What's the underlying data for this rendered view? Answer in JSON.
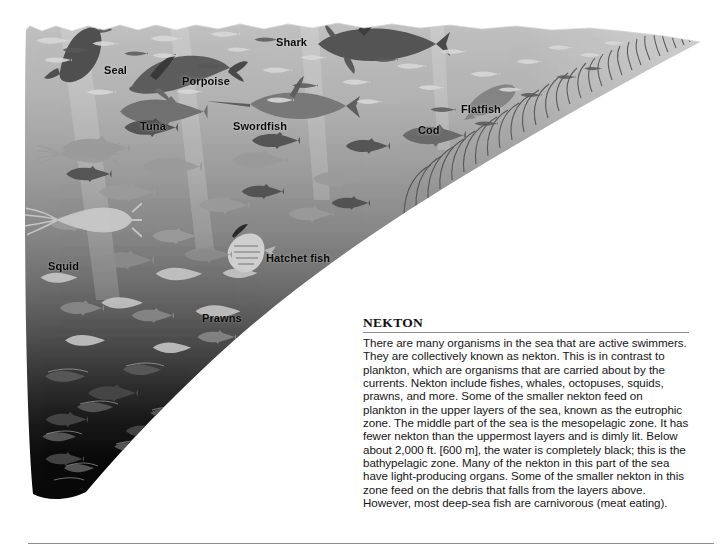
{
  "figure": {
    "title_visible": false,
    "scene_name": "ocean-cross-section",
    "description_alt": "Grayscale cross-section illustration of the ocean from surface to deep sea showing nekton organisms at different depths"
  },
  "labels": [
    {
      "id": "seal",
      "text": "Seal",
      "x": 104,
      "y": 64,
      "tone": "light"
    },
    {
      "id": "shark",
      "text": "Shark",
      "x": 276,
      "y": 36,
      "tone": "light"
    },
    {
      "id": "porpoise",
      "text": "Porpoise",
      "x": 182,
      "y": 75,
      "tone": "light"
    },
    {
      "id": "flatfish",
      "text": "Flatfish",
      "x": 461,
      "y": 103,
      "tone": "light"
    },
    {
      "id": "tuna",
      "text": "Tuna",
      "x": 140,
      "y": 120,
      "tone": "light"
    },
    {
      "id": "swordfish",
      "text": "Swordfish",
      "x": 233,
      "y": 120,
      "tone": "light"
    },
    {
      "id": "cod",
      "text": "Cod",
      "x": 418,
      "y": 124,
      "tone": "light"
    },
    {
      "id": "squid",
      "text": "Squid",
      "x": 48,
      "y": 260,
      "tone": "dark"
    },
    {
      "id": "hatchetfish",
      "text": "Hatchet fish",
      "x": 266,
      "y": 252,
      "tone": "dark"
    },
    {
      "id": "prawns",
      "text": "Prawns",
      "x": 202,
      "y": 312,
      "tone": "dark"
    }
  ],
  "caption": {
    "heading": "NEKTON",
    "body": "There are many organisms in the sea that are active swimmers. They are collectively known as nekton. This is in contrast to plankton, which are organisms that are carried about by the currents. Nekton include fishes, whales, octopuses, squids, prawns, and more. Some of the smaller nekton feed on plankton in the upper layers of the sea, known as the eutrophic zone. The middle part of the sea is the mesopelagic zone. It has fewer nekton than the uppermost layers and is dimly lit. Below about 2,000 ft. [600 m], the water is completely black; this is the bathypelagic zone. Many of the nekton in this part of the sea have light-producing organs. Some of the smaller nekton in this zone feed on the debris that falls from the layers above. However, most deep-sea fish are carnivorous (meat eating)."
  },
  "colors": {
    "page_background": "#ffffff",
    "surface_water": "#c2c2c2",
    "upper_water": "#b0b0b0",
    "mid_water": "#6e6e6e",
    "deep_water": "#1c1c1c",
    "abyss_water": "#000000",
    "rule": "#8d8d8d",
    "text": "#161616",
    "label_text": "#0a0a0a"
  },
  "zones": [
    {
      "name": "eutrophic zone",
      "depth_hint": "upper layers"
    },
    {
      "name": "mesopelagic zone",
      "depth_hint": "middle part, dimly lit"
    },
    {
      "name": "bathypelagic zone",
      "depth_hint": "below about 2,000 ft. [600 m], completely black"
    }
  ]
}
